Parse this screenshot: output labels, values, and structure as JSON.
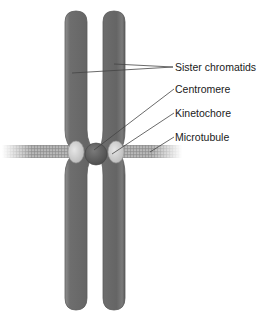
{
  "diagram": {
    "top_caption_partial": "",
    "labels": {
      "sister_chromatids": "Sister chromatids",
      "centromere": "Centromere",
      "kinetochore": "Kinetochore",
      "microtubule": "Microtubule"
    },
    "colors": {
      "chromatid_fill": "#6b6b6b",
      "chromatid_edge": "#9a9a9a",
      "chromatid_highlight": "#8a8a8a",
      "centromere_fill": "#5a5a5a",
      "kinetochore_fill": "#d4d4d4",
      "microtubule_fill": "#a8a8a8",
      "leader_line": "#444444",
      "label_text": "#1a1a1a"
    }
  }
}
